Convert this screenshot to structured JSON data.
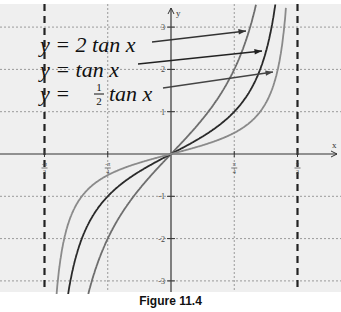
{
  "caption": "Figure 11.4",
  "chart_data": {
    "type": "line",
    "title": "",
    "xlabel": "x",
    "ylabel": "y",
    "xlim": [
      -1.5708,
      1.5708
    ],
    "ylim": [
      -3.4,
      3.5
    ],
    "grid": true,
    "x_ticks": [
      {
        "value": -1.5708,
        "label": "-π/2"
      },
      {
        "value": -0.7854,
        "label": "-π/4"
      },
      {
        "value": 0.7854,
        "label": "π/4"
      },
      {
        "value": 1.5708,
        "label": "π/2"
      }
    ],
    "y_ticks": [
      {
        "value": 3,
        "label": "3"
      },
      {
        "value": 2,
        "label": "2"
      },
      {
        "value": 1,
        "label": "1"
      },
      {
        "value": -1,
        "label": "-1"
      },
      {
        "value": -2,
        "label": "-2"
      },
      {
        "value": -3,
        "label": "-3"
      }
    ],
    "asymptotes": [
      {
        "x": -1.5708,
        "label": "x = -π/2",
        "style": "dashed"
      },
      {
        "x": 1.5708,
        "label": "x = π/2",
        "style": "dashed"
      }
    ],
    "series": [
      {
        "name": "y = 2 tan x",
        "coefficient": 2,
        "color": "#6e6e6e",
        "annotation": "y = 2 tan x"
      },
      {
        "name": "y = tan x",
        "coefficient": 1,
        "color": "#2a2a2a",
        "annotation": "y = tan x"
      },
      {
        "name": "y = 1/2 tan x",
        "coefficient": 0.5,
        "color": "#8a8a8a",
        "annotation": "y = ½ tan x"
      }
    ],
    "legend_position": "upper-left annotations with arrows"
  },
  "labels": {
    "axis_x": "x",
    "axis_y": "y",
    "eq1_prefix": "y = 2 tan x",
    "eq2": "y = tan x",
    "eq3_y": "y = ",
    "eq3_num": "1",
    "eq3_den": "2",
    "eq3_tail": "tan x"
  },
  "colors": {
    "background": "#efefef",
    "grid": "#9a9a9a",
    "axis": "#333333"
  }
}
